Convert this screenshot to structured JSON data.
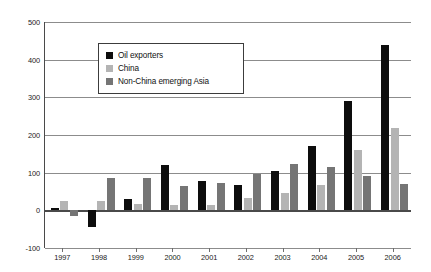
{
  "chart_data": {
    "type": "bar",
    "title": "",
    "subtitle": "",
    "xlabel": "",
    "ylabel": "",
    "categories": [
      "1997",
      "1998",
      "1999",
      "2000",
      "2001",
      "2002",
      "2003",
      "2004",
      "2005",
      "2006"
    ],
    "series": [
      {
        "name": "Oil exporters",
        "color": "#0d0d0d",
        "values": [
          5,
          -45,
          30,
          120,
          78,
          66,
          105,
          171,
          291,
          440
        ]
      },
      {
        "name": "China",
        "color": "#b4b4b4",
        "values": [
          25,
          25,
          18,
          15,
          14,
          33,
          45,
          68,
          160,
          218
        ]
      },
      {
        "name": "Non-China emerging Asia",
        "color": "#757575",
        "values": [
          -15,
          85,
          87,
          65,
          73,
          96,
          122,
          115,
          90,
          69
        ]
      }
    ],
    "ylim": [
      -100,
      500
    ],
    "ytick_values": [
      -100,
      0,
      100,
      200,
      300,
      400,
      500
    ],
    "ytick_labels": [
      "-100",
      "0",
      "100",
      "200",
      "300",
      "400",
      "500"
    ],
    "grid": true,
    "legend_position": "upper-left-inside",
    "zero_line": 0,
    "background_color": "#ffffff",
    "axis_color": "#4a4a4a",
    "grid_color": "#8c8c8c"
  }
}
